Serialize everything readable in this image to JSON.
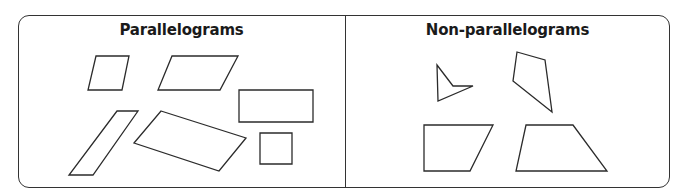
{
  "panels": [
    {
      "title": "Parallelograms",
      "shapes": [
        {
          "name": "rhombus-small",
          "points": "96,56 129,56 122,90 88,90"
        },
        {
          "name": "parallelogram-wide",
          "points": "172,56 238,56 220,90 158,90"
        },
        {
          "name": "rectangle",
          "points": "239,90 313,90 313,122 239,122"
        },
        {
          "name": "parallelogram-tall-slanted",
          "points": "117,111 138,111 93,175 69,175"
        },
        {
          "name": "rectangle-tilted",
          "points": "161,111 246,138 219,171 134,143"
        },
        {
          "name": "square",
          "points": "260,133 292,133 292,164 260,164"
        }
      ]
    },
    {
      "title": "Non-parallelograms",
      "shapes": [
        {
          "name": "concave-quadrilateral",
          "points": "437,65 453,86 473,86 438,101"
        },
        {
          "name": "kite-irregular",
          "points": "517,52 545,60 552,112 513,81"
        },
        {
          "name": "right-trapezoid",
          "points": "424,125 493,125 470,171 424,171"
        },
        {
          "name": "trapezoid",
          "points": "526,125 573,125 607,171 516,171"
        }
      ]
    }
  ],
  "colors": {
    "stroke": "#2b2b2b",
    "border": "#333333",
    "background": "#ffffff"
  }
}
